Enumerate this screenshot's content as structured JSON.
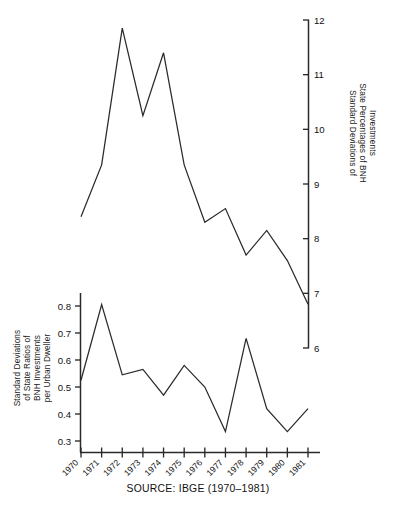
{
  "figure": {
    "source_note": "SOURCE: IBGE (1970–1981)",
    "background_color": "#ffffff",
    "line_color": "#2a2a2a",
    "axis_color": "#2a2a2a"
  },
  "upper_panel": {
    "axis_title_lines": [
      "Standard Deviations of",
      "State Percentages of BNH",
      "Investments"
    ],
    "axis_position": "right",
    "tick_labels": [
      "12",
      "11",
      "10",
      "9",
      "8",
      "7",
      "6"
    ]
  },
  "lower_panel": {
    "axis_title_lines": [
      "Standard Deviations",
      "of State Ratios of",
      "BNH Investments",
      "per Urban Dweller"
    ],
    "axis_position": "left",
    "tick_labels": [
      "0.8",
      "0.7",
      "0.6",
      "0.5",
      "0.4",
      "0.3"
    ],
    "x_tick_labels": [
      "1970",
      "1971",
      "1972",
      "1973",
      "1974",
      "1975",
      "1976",
      "1977",
      "1978",
      "1979",
      "1980",
      "1981"
    ]
  },
  "chart_data": [
    {
      "type": "line",
      "title": "Standard Deviations of State Percentages of BNH Investments",
      "xlabel": "",
      "ylabel": "Standard Deviations of State Percentages of BNH Investments",
      "x": [
        "1970",
        "1971",
        "1972",
        "1973",
        "1974",
        "1975",
        "1976",
        "1977",
        "1978",
        "1979",
        "1980",
        "1981"
      ],
      "values": [
        8.4,
        9.35,
        11.85,
        10.25,
        11.4,
        9.35,
        8.3,
        8.55,
        7.7,
        8.15,
        7.6,
        6.8
      ],
      "ylim": [
        6,
        12
      ],
      "yticks": [
        6,
        7,
        8,
        9,
        10,
        11,
        12
      ],
      "axis_side": "right",
      "grid": false,
      "legend": "none"
    },
    {
      "type": "line",
      "title": "Standard Deviations of State Ratios of BNH Investments per Urban Dweller",
      "xlabel": "",
      "ylabel": "Standard Deviations of State Ratios of BNH Investments per Urban Dweller",
      "x": [
        "1970",
        "1971",
        "1972",
        "1973",
        "1974",
        "1975",
        "1976",
        "1977",
        "1978",
        "1979",
        "1980",
        "1981"
      ],
      "values": [
        0.525,
        0.805,
        0.545,
        0.565,
        0.47,
        0.58,
        0.5,
        0.335,
        0.68,
        0.42,
        0.335,
        0.42
      ],
      "ylim": [
        0.25,
        0.84
      ],
      "yticks": [
        0.3,
        0.4,
        0.5,
        0.6,
        0.7,
        0.8
      ],
      "axis_side": "left",
      "grid": false,
      "legend": "none"
    }
  ]
}
